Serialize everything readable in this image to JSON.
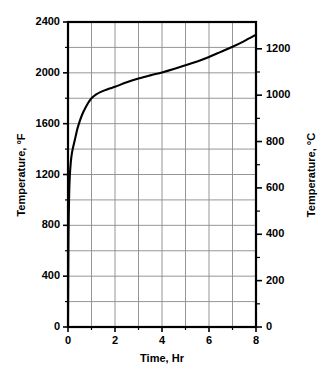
{
  "chart_data": {
    "type": "line",
    "title": "",
    "xlabel": "Time, Hr",
    "ylabel": "Temperature, °F",
    "ylabel_right": "Temperature, °C",
    "xlim": [
      0,
      8
    ],
    "ylim": [
      0,
      2400
    ],
    "ylim_right": [
      0,
      1315.6
    ],
    "grid": true,
    "legend": false,
    "x_ticks": [
      0,
      1,
      2,
      3,
      4,
      5,
      6,
      7,
      8
    ],
    "x_tick_labels": [
      "0",
      "",
      "2",
      "",
      "4",
      "",
      "6",
      "",
      "8"
    ],
    "y_ticks_left": [
      0,
      200,
      400,
      600,
      800,
      1000,
      1200,
      1400,
      1600,
      1800,
      2000,
      2200,
      2400
    ],
    "y_tick_labels_left": [
      "0",
      "",
      "400",
      "",
      "800",
      "",
      "1200",
      "",
      "1600",
      "",
      "2000",
      "",
      "2400"
    ],
    "y_ticks_right": [
      0,
      100,
      200,
      300,
      400,
      500,
      600,
      700,
      800,
      900,
      1000,
      1100,
      1200
    ],
    "y_tick_labels_right": [
      "0",
      "",
      "200",
      "",
      "400",
      "",
      "600",
      "",
      "800",
      "",
      "1000",
      "",
      "1200"
    ],
    "series": [
      {
        "name": "Furnace temperature",
        "x": [
          0.0,
          0.02,
          0.05,
          0.08,
          0.12,
          0.16,
          0.2,
          0.25,
          0.3,
          0.35,
          0.4,
          0.5,
          0.6,
          0.7,
          0.8,
          0.9,
          1.0,
          1.2,
          1.4,
          1.6,
          1.8,
          2.0,
          2.5,
          3.0,
          3.5,
          4.0,
          4.5,
          5.0,
          5.5,
          6.0,
          6.5,
          7.0,
          7.5,
          8.0
        ],
        "y": [
          0,
          700,
          1050,
          1200,
          1300,
          1360,
          1400,
          1440,
          1480,
          1520,
          1560,
          1620,
          1670,
          1710,
          1745,
          1775,
          1800,
          1830,
          1850,
          1865,
          1878,
          1890,
          1925,
          1955,
          1980,
          2003,
          2030,
          2060,
          2090,
          2125,
          2165,
          2205,
          2250,
          2300
        ]
      }
    ],
    "annotations": []
  },
  "axes": {
    "x_title": "Time, Hr",
    "y_title_left": "Temperature, °F",
    "y_title_right": "Temperature, °C"
  },
  "style": {
    "curve_color": "#000000",
    "grid_color": "#8a8a8a",
    "frame_color": "#000000",
    "background": "#ffffff"
  }
}
